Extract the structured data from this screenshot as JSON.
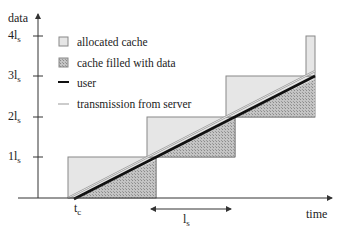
{
  "axes": {
    "y_label": "data",
    "x_label": "time",
    "y_ticks": [
      {
        "base": "1l",
        "sub": "s",
        "y": 157
      },
      {
        "base": "2l",
        "sub": "s",
        "y": 117
      },
      {
        "base": "3l",
        "sub": "s",
        "y": 76
      },
      {
        "base": "4l",
        "sub": "s",
        "y": 36
      }
    ]
  },
  "markers": {
    "tc": {
      "base": "t",
      "sub": "c"
    },
    "ls_span": {
      "base": "l",
      "sub": "s"
    }
  },
  "legend": {
    "items": [
      {
        "label": "allocated cache",
        "type": "box-light"
      },
      {
        "label": "cache filled  with data",
        "type": "box-hatched"
      },
      {
        "label": "user",
        "type": "line-thick"
      },
      {
        "label": "transmission from server",
        "type": "line-thin"
      }
    ]
  },
  "colors": {
    "allocated": "#e4e4e4",
    "filled": "#b8b8b8",
    "user_line": "#111111",
    "server_line": "#9a9a9a",
    "axis": "#333333"
  }
}
